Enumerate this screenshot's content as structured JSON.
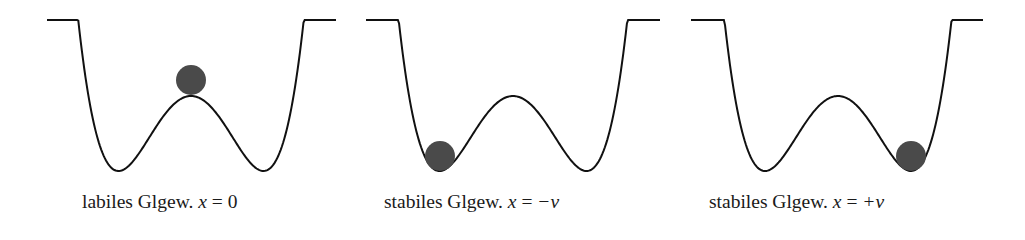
{
  "figure": {
    "colors": {
      "curve": "#111111",
      "ball": "#4a4a4a",
      "text": "#1a1a1a"
    },
    "panels": [
      {
        "id": "labile",
        "label_text": "labiles Glgew.",
        "label_var": "x",
        "label_eq": "=",
        "label_value": "0",
        "curve": {
          "left_top": [
            47,
            20
          ],
          "right_top": [
            336,
            20
          ],
          "min_left": [
            118,
            171
          ],
          "min_right": [
            263,
            171
          ],
          "peak": [
            191,
            96
          ]
        },
        "ball": {
          "cx": 191,
          "cy": 80,
          "r": 15
        },
        "label_x": 82
      },
      {
        "id": "stabil-minus",
        "label_text": "stabiles Glgew.",
        "label_var": "x",
        "label_eq": "=",
        "label_value": "−v",
        "curve": {
          "left_top": [
            366,
            20
          ],
          "right_top": [
            660,
            20
          ],
          "min_left": [
            440,
            171
          ],
          "min_right": [
            587,
            171
          ],
          "peak": [
            513,
            96
          ]
        },
        "ball": {
          "cx": 440,
          "cy": 156,
          "r": 15
        },
        "label_x": 384
      },
      {
        "id": "stabil-plus",
        "label_text": "stabiles Glgew.",
        "label_var": "x",
        "label_eq": "=",
        "label_value": "+v",
        "curve": {
          "left_top": [
            691,
            20
          ],
          "right_top": [
            983,
            20
          ],
          "min_left": [
            765,
            171
          ],
          "min_right": [
            911,
            171
          ],
          "peak": [
            838,
            96
          ]
        },
        "ball": {
          "cx": 911,
          "cy": 156,
          "r": 15
        },
        "label_x": 709
      }
    ]
  }
}
